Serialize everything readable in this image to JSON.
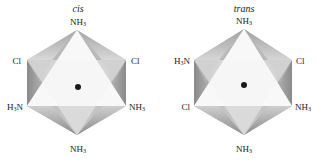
{
  "figure": {
    "panels": [
      {
        "title": "cis",
        "center_atom": "metal-dot",
        "ligands": {
          "top": "NH3",
          "upper_left": "Cl",
          "upper_right": "Cl",
          "lower_left": "H3N",
          "lower_right": "NH3",
          "bottom": "NH3"
        }
      },
      {
        "title": "trans",
        "center_atom": "metal-dot",
        "ligands": {
          "top": "NH3",
          "upper_left": "H3N",
          "upper_right": "Cl",
          "lower_left": "Cl",
          "lower_right": "NH3",
          "bottom": "NH3"
        }
      }
    ],
    "colors": {
      "face_light": "#f4f4f4",
      "face_mid": "#c8c8c8",
      "face_dark": "#8e8e8e",
      "dot": "#1a1a1a"
    }
  }
}
